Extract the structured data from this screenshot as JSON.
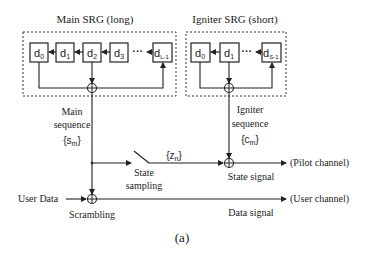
{
  "main_srg": {
    "title": "Main SRG (long)",
    "cells": [
      {
        "base": "d",
        "sub": "0"
      },
      {
        "base": "d",
        "sub": "1"
      },
      {
        "base": "d",
        "sub": "2"
      },
      {
        "base": "d",
        "sub": "3"
      },
      {
        "base": "d",
        "sub": "L-1"
      }
    ],
    "ellipsis": "···"
  },
  "igniter_srg": {
    "title": "Igniter SRG (short)",
    "cells": [
      {
        "base": "d",
        "sub": "0"
      },
      {
        "base": "d",
        "sub": "1"
      },
      {
        "base": "d",
        "sub": "S-1"
      }
    ],
    "ellipsis": "···"
  },
  "labels": {
    "main_sequence_1": "Main",
    "main_sequence_2": "sequence",
    "main_sequence_sym_base": "s",
    "main_sequence_sym_sub": "m",
    "igniter_sequence_1": "Igniter",
    "igniter_sequence_2": "sequence",
    "igniter_sequence_sym_base": "c",
    "igniter_sequence_sym_sub": "m",
    "zn_base": "z",
    "zn_sub": "n",
    "state_sampling_1": "State",
    "state_sampling_2": "sampling",
    "state_signal": "State signal",
    "pilot_channel": "(Pilot channel)",
    "user_data": "User Data",
    "scrambling": "Scrambling",
    "data_signal": "Data signal",
    "user_channel": "(User channel)",
    "caption": "(a)"
  }
}
